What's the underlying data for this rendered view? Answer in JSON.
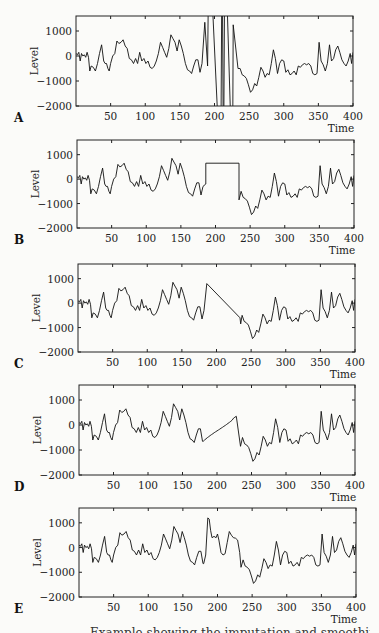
{
  "chart_data": [
    {
      "panel": "A",
      "type": "line",
      "xlabel": "Time",
      "ylabel": "Level",
      "xlim": [
        0,
        400
      ],
      "ylim": [
        -2000,
        1600
      ],
      "xticks": [
        50,
        100,
        150,
        200,
        250,
        300,
        350,
        400
      ],
      "yticks": [
        1000,
        0,
        -1000,
        -2000
      ],
      "description": "Original series with outliers",
      "modification": "outliers",
      "outliers": [
        {
          "x": 186,
          "y": 1350
        },
        {
          "x": 190,
          "y": -400
        },
        {
          "x": 192,
          "y": 5000
        },
        {
          "x": 209,
          "y": -5000
        },
        {
          "x": 211,
          "y": 5000
        },
        {
          "x": 213,
          "y": -5000
        },
        {
          "x": 215,
          "y": 5000
        },
        {
          "x": 226,
          "y": -5000
        },
        {
          "x": 227,
          "y": 1250
        }
      ]
    },
    {
      "panel": "B",
      "type": "line",
      "xlabel": "Time",
      "ylabel": "Level",
      "xlim": [
        0,
        400
      ],
      "ylim": [
        -2000,
        1600
      ],
      "xticks": [
        50,
        100,
        150,
        200,
        250,
        300,
        350,
        400
      ],
      "yticks": [
        1000,
        0,
        -1000,
        -2000
      ],
      "description": "Gap filled with constant value",
      "modification": "constant",
      "gap": {
        "start": 186,
        "end": 234,
        "value": 650
      }
    },
    {
      "panel": "C",
      "type": "line",
      "xlabel": "Time",
      "ylabel": "Level",
      "xlim": [
        0,
        400
      ],
      "ylim": [
        -2000,
        1600
      ],
      "xticks": [
        50,
        100,
        150,
        200,
        250,
        300,
        350,
        400
      ],
      "yticks": [
        1000,
        0,
        -1000,
        -2000
      ],
      "description": "Gap filled by linear interpolation",
      "modification": "linear",
      "gap": {
        "start": 186,
        "end": 234,
        "from": 800,
        "to": -600
      }
    },
    {
      "panel": "D",
      "type": "line",
      "xlabel": "Time",
      "ylabel": "Level",
      "xlim": [
        0,
        400
      ],
      "ylim": [
        -2000,
        1600
      ],
      "xticks": [
        50,
        100,
        150,
        200,
        250,
        300,
        350,
        400
      ],
      "yticks": [
        1000,
        0,
        -1000,
        -2000
      ],
      "description": "Gap filled with smooth curve",
      "modification": "smooth",
      "gap": {
        "start": 180,
        "end": 228,
        "from": -650,
        "to": 350
      }
    },
    {
      "panel": "E",
      "type": "line",
      "xlabel": "Time",
      "ylabel": "Level",
      "xlim": [
        0,
        400
      ],
      "ylim": [
        -2000,
        1600
      ],
      "xticks": [
        50,
        100,
        150,
        200,
        250,
        300,
        350,
        400
      ],
      "yticks": [
        1000,
        0,
        -1000,
        -2000
      ],
      "description": "Gap filled with plausible stochastic values",
      "modification": "replace",
      "replacement": [
        [
          180,
          -650
        ],
        [
          183,
          -300
        ],
        [
          186,
          1200
        ],
        [
          188,
          1150
        ],
        [
          190,
          700
        ],
        [
          192,
          400
        ],
        [
          195,
          450
        ],
        [
          198,
          400
        ],
        [
          200,
          550
        ],
        [
          202,
          300
        ],
        [
          205,
          -200
        ],
        [
          208,
          -300
        ],
        [
          211,
          -250
        ],
        [
          214,
          200
        ],
        [
          217,
          650
        ],
        [
          220,
          500
        ],
        [
          223,
          400
        ],
        [
          226,
          380
        ],
        [
          229,
          300
        ],
        [
          232,
          -200
        ],
        [
          234,
          -800
        ]
      ]
    }
  ],
  "base_series": {
    "x": [
      0,
      2,
      4,
      6,
      8,
      10,
      12,
      14,
      16,
      18,
      20,
      22,
      25,
      28,
      31,
      34,
      37,
      40,
      42,
      44,
      46,
      48,
      50,
      53,
      56,
      59,
      62,
      65,
      68,
      71,
      74,
      77,
      80,
      83,
      86,
      89,
      92,
      95,
      98,
      101,
      104,
      107,
      110,
      113,
      116,
      119,
      122,
      125,
      128,
      131,
      134,
      137,
      140,
      143,
      146,
      149,
      152,
      155,
      158,
      161,
      164,
      167,
      170,
      173,
      176,
      179,
      182,
      186,
      234,
      237,
      240,
      243,
      246,
      249,
      252,
      255,
      258,
      261,
      264,
      267,
      270,
      273,
      276,
      279,
      282,
      285,
      288,
      291,
      294,
      297,
      300,
      303,
      306,
      309,
      312,
      315,
      318,
      321,
      324,
      327,
      330,
      333,
      336,
      339,
      342,
      345,
      348,
      351,
      354,
      357,
      360,
      363,
      366,
      369,
      372,
      375,
      378,
      381,
      384,
      387,
      390,
      393,
      396,
      398,
      400
    ],
    "y": [
      100,
      50,
      150,
      -200,
      100,
      0,
      50,
      -50,
      150,
      -50,
      -600,
      -400,
      -450,
      -600,
      -300,
      100,
      450,
      -200,
      -300,
      -300,
      -500,
      -600,
      -300,
      0,
      100,
      600,
      500,
      550,
      650,
      400,
      300,
      -100,
      -150,
      -300,
      -100,
      -300,
      150,
      -200,
      -100,
      -300,
      -200,
      -450,
      -500,
      -400,
      -200,
      100,
      550,
      350,
      150,
      -50,
      300,
      850,
      700,
      550,
      200,
      650,
      400,
      100,
      -300,
      -550,
      -600,
      -700,
      -400,
      -150,
      -150,
      -650,
      -300,
      -200,
      -850,
      -500,
      -750,
      -800,
      -900,
      -1150,
      -1450,
      -1350,
      -1100,
      -1200,
      -850,
      -450,
      -600,
      -850,
      -700,
      -750,
      -300,
      250,
      -100,
      -700,
      -300,
      -150,
      -200,
      -650,
      -550,
      -750,
      -700,
      -600,
      -750,
      -400,
      -450,
      -350,
      -300,
      -350,
      -300,
      -400,
      -700,
      -750,
      -700,
      550,
      -200,
      -350,
      -600,
      -300,
      450,
      -200,
      -100,
      250,
      400,
      150,
      -150,
      -300,
      -400,
      -200,
      100,
      -300,
      150
    ]
  },
  "panels": [
    {
      "letter": "A",
      "xlabel": "Time",
      "ylabel": "Level"
    },
    {
      "letter": "B",
      "xlabel": "Time",
      "ylabel": "Level"
    },
    {
      "letter": "C",
      "xlabel": "Time",
      "ylabel": "Level"
    },
    {
      "letter": "D",
      "xlabel": "Time",
      "ylabel": "Level"
    },
    {
      "letter": "E",
      "xlabel": "Time",
      "ylabel": "Level"
    }
  ],
  "caption": "Example showing the imputation and smoothing of missing or anomalous data"
}
